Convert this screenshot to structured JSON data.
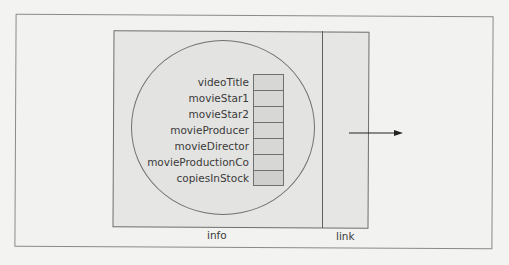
{
  "diagram": {
    "node": {
      "info_label": "info",
      "link_label": "link"
    },
    "fields": [
      {
        "name": "videoTitle"
      },
      {
        "name": "movieStar1"
      },
      {
        "name": "movieStar2"
      },
      {
        "name": "movieProducer"
      },
      {
        "name": "movieDirector"
      },
      {
        "name": "movieProductionCo"
      },
      {
        "name": "copiesInStock"
      }
    ],
    "arrow": {
      "direction": "right"
    },
    "colors": {
      "background": "#f3f3f1",
      "node_fill": "#e6e6e4",
      "cell_fill": "#d7d7d5",
      "stroke": "#707070",
      "text": "#3a3a3a"
    }
  }
}
